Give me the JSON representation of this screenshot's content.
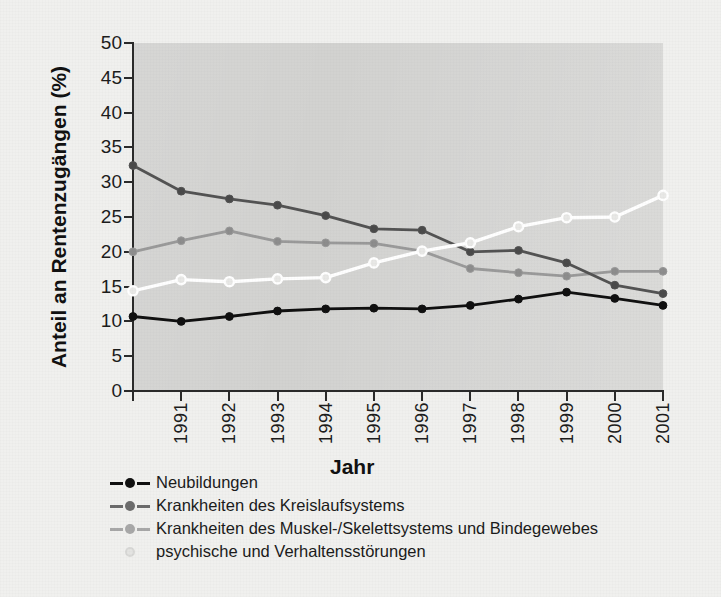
{
  "chart_data": {
    "type": "line",
    "title": "",
    "xlabel": "Jahr",
    "ylabel": "Anteil an Rentenzugängen (%)",
    "x": [
      1990,
      1991,
      1992,
      1993,
      1994,
      1995,
      1996,
      1997,
      1998,
      1999,
      2000,
      2001
    ],
    "x_tick_labels": [
      "1991",
      "1992",
      "1993",
      "1994",
      "1995",
      "1996",
      "1997",
      "1998",
      "1999",
      "2000",
      "2001"
    ],
    "y_tick_labels": [
      "0",
      "5",
      "10",
      "15",
      "20",
      "25",
      "30",
      "35",
      "40",
      "45",
      "50"
    ],
    "xlim": [
      1990,
      2001
    ],
    "ylim": [
      0,
      50
    ],
    "ytick_step": 5,
    "grid": false,
    "legend_position": "below-plot-left",
    "plot_background": "#d2d2d0",
    "series": [
      {
        "name": "Neubildungen",
        "color": "#101010",
        "marker": "filled-circle",
        "marker_face": "#101010",
        "values": [
          10.7,
          10.0,
          10.7,
          11.5,
          11.8,
          11.9,
          11.8,
          12.3,
          13.2,
          14.2,
          13.3,
          12.3
        ]
      },
      {
        "name": "Krankheiten des Kreislaufsystems",
        "color": "#535353",
        "marker": "filled-circle",
        "marker_face": "#4a4a4a",
        "values": [
          32.4,
          28.7,
          27.6,
          26.7,
          25.2,
          23.3,
          23.1,
          20.0,
          20.2,
          18.4,
          15.2,
          14.0
        ]
      },
      {
        "name": "Krankheiten des Muskel-/Skelettsystems und Bindegewebes",
        "color": "#9a9a9a",
        "marker": "filled-circle",
        "marker_face": "#8d8d8d",
        "values": [
          20.0,
          21.6,
          23.0,
          21.5,
          21.3,
          21.2,
          20.1,
          17.6,
          17.0,
          16.5,
          17.2,
          17.2
        ]
      },
      {
        "name": "psychische und Verhaltensstörungen",
        "color": "#ffffff",
        "marker": "open-circle",
        "marker_face": "#e8e8e6",
        "values": [
          14.4,
          16.0,
          15.7,
          16.1,
          16.3,
          18.4,
          20.1,
          21.3,
          23.6,
          24.9,
          25.0,
          28.1
        ]
      }
    ]
  },
  "legend": {
    "items": [
      {
        "label": "Neubildungen",
        "color": "#101010",
        "marker": "filled-circle"
      },
      {
        "label": "Krankheiten des Kreislaufsystems",
        "color": "#6b6b6b",
        "marker": "filled-circle"
      },
      {
        "label": "Krankheiten des Muskel-/Skelettsystems und Bindegewebes",
        "color": "#a8a8a8",
        "marker": "filled-circle"
      },
      {
        "label": "psychische und Verhaltensstörungen",
        "color": "#d8d8d6",
        "marker": "open-circle"
      }
    ]
  }
}
